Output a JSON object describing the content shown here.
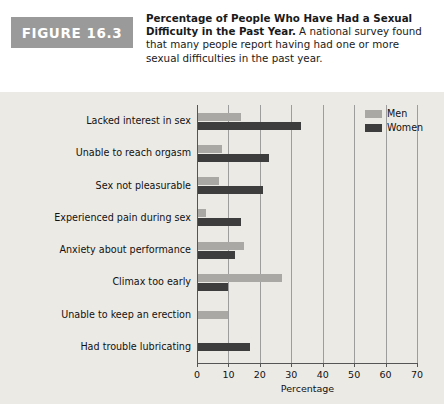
{
  "figure": {
    "badge": "FIGURE 16.3",
    "caption_bold": "Percentage of People Who Have Had a Sexual Difficulty in the Past Year.",
    "caption_rest": " A national survey found that many people report having had one or more sexual difficulties in the past year."
  },
  "legend": {
    "men_label": "Men",
    "women_label": "Women",
    "men_color": "#a9a8a4",
    "women_color": "#3d3d3d"
  },
  "chart_data": {
    "type": "bar",
    "orientation": "horizontal",
    "title": "Percentage of People Who Have Had a Sexual Difficulty in the Past Year",
    "xlabel": "Percentage",
    "ylabel": "",
    "xlim": [
      0,
      70
    ],
    "xticks": [
      0,
      10,
      20,
      30,
      40,
      50,
      60,
      70
    ],
    "xticklabels": [
      "0",
      "10",
      "20",
      "30",
      "40",
      "50",
      "60",
      "70"
    ],
    "grid": true,
    "legend_position": "top-right",
    "categories": [
      "Lacked interest in sex",
      "Unable to reach orgasm",
      "Sex not pleasurable",
      "Experienced pain during sex",
      "Anxiety about performance",
      "Climax too early",
      "Unable to keep an erection",
      "Had trouble lubricating"
    ],
    "series": [
      {
        "name": "Men",
        "color": "#a9a8a4",
        "values": [
          14,
          8,
          7,
          3,
          15,
          27,
          10,
          null
        ]
      },
      {
        "name": "Women",
        "color": "#3d3d3d",
        "values": [
          33,
          23,
          21,
          14,
          12,
          10,
          null,
          17
        ]
      }
    ]
  }
}
